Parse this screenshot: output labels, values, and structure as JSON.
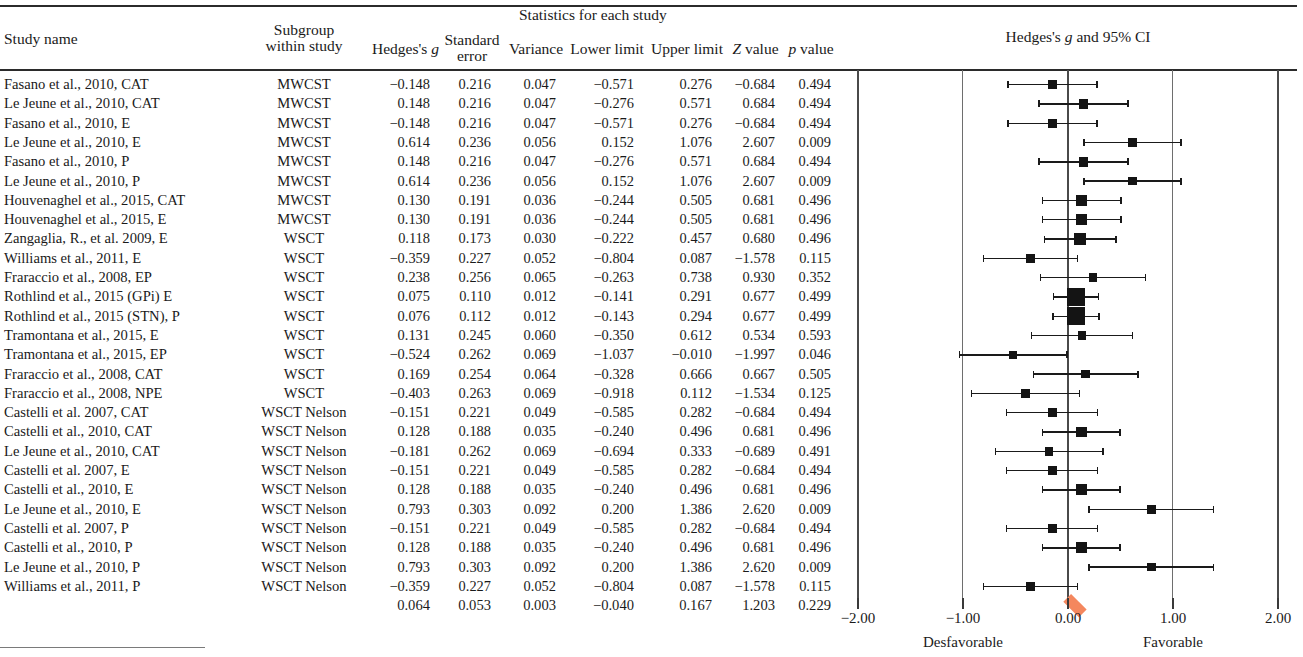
{
  "header": {
    "study_name": "Study name",
    "subgroup_line1": "Subgroup",
    "subgroup_line2": "within study",
    "statistics_group": "Statistics for each study",
    "hedges_g": "Hedges's g",
    "standard_line1": "Standard",
    "standard_line2": "error",
    "variance": "Variance",
    "lower_limit": "Lower limit",
    "upper_limit": "Upper limit",
    "z_value": "Z value",
    "p_value": "p value",
    "plot_title": "Hedges's g and 95% CI"
  },
  "axis": {
    "ticks": [
      "-2.00",
      "-1.00",
      "0.00",
      "1.00",
      "2.00"
    ],
    "tick_values": [
      -2,
      -1,
      0,
      1,
      2
    ],
    "left_label": "Desfavorable",
    "right_label": "Favorable",
    "xlim": [
      -2.2,
      2.2
    ],
    "summary_color": "#f4875e",
    "marker_color": "#141414"
  },
  "chart_data": {
    "type": "forest",
    "title": "Hedges's g and 95% CI",
    "xlabel": "",
    "ylabel": "",
    "xlim": [
      -2.2,
      2.2
    ],
    "grid": true,
    "effect_measure": "Hedges's g",
    "columns": [
      "Study name",
      "Subgroup within study",
      "Hedges's g",
      "Standard error",
      "Variance",
      "Lower limit",
      "Upper limit",
      "Z value",
      "p value"
    ],
    "rows": [
      {
        "study": "Fasano et al., 2010, CAT",
        "subgroup": "MWCST",
        "g": "-0.148",
        "se": "0.216",
        "var": "0.047",
        "lower": "-0.571",
        "upper": "0.276",
        "z": "-0.684",
        "p": "0.494",
        "g_v": -0.148,
        "se_v": 0.216,
        "lo_v": -0.571,
        "hi_v": 0.276
      },
      {
        "study": "Le Jeune et al., 2010, CAT",
        "subgroup": "MWCST",
        "g": "0.148",
        "se": "0.216",
        "var": "0.047",
        "lower": "-0.276",
        "upper": "0.571",
        "z": "0.684",
        "p": "0.494",
        "g_v": 0.148,
        "se_v": 0.216,
        "lo_v": -0.276,
        "hi_v": 0.571
      },
      {
        "study": "Fasano et al., 2010, E",
        "subgroup": "MWCST",
        "g": "-0.148",
        "se": "0.216",
        "var": "0.047",
        "lower": "-0.571",
        "upper": "0.276",
        "z": "-0.684",
        "p": "0.494",
        "g_v": -0.148,
        "se_v": 0.216,
        "lo_v": -0.571,
        "hi_v": 0.276
      },
      {
        "study": "Le Jeune et al., 2010, E",
        "subgroup": "MWCST",
        "g": "0.614",
        "se": "0.236",
        "var": "0.056",
        "lower": "0.152",
        "upper": "1.076",
        "z": "2.607",
        "p": "0.009",
        "g_v": 0.614,
        "se_v": 0.236,
        "lo_v": 0.152,
        "hi_v": 1.076
      },
      {
        "study": "Fasano et al., 2010, P",
        "subgroup": "MWCST",
        "g": "0.148",
        "se": "0.216",
        "var": "0.047",
        "lower": "-0.276",
        "upper": "0.571",
        "z": "0.684",
        "p": "0.494",
        "g_v": 0.148,
        "se_v": 0.216,
        "lo_v": -0.276,
        "hi_v": 0.571
      },
      {
        "study": "Le Jeune et al., 2010, P",
        "subgroup": "MWCST",
        "g": "0.614",
        "se": "0.236",
        "var": "0.056",
        "lower": "0.152",
        "upper": "1.076",
        "z": "2.607",
        "p": "0.009",
        "g_v": 0.614,
        "se_v": 0.236,
        "lo_v": 0.152,
        "hi_v": 1.076
      },
      {
        "study": "Houvenaghel et al., 2015, CAT",
        "subgroup": "MWCST",
        "g": "0.130",
        "se": "0.191",
        "var": "0.036",
        "lower": "-0.244",
        "upper": "0.505",
        "z": "0.681",
        "p": "0.496",
        "g_v": 0.13,
        "se_v": 0.191,
        "lo_v": -0.244,
        "hi_v": 0.505
      },
      {
        "study": "Houvenaghel et al., 2015, E",
        "subgroup": "MWCST",
        "g": "0.130",
        "se": "0.191",
        "var": "0.036",
        "lower": "-0.244",
        "upper": "0.505",
        "z": "0.681",
        "p": "0.496",
        "g_v": 0.13,
        "se_v": 0.191,
        "lo_v": -0.244,
        "hi_v": 0.505
      },
      {
        "study": "Zangaglia, R., et al. 2009, E",
        "subgroup": "WSCT",
        "g": "0.118",
        "se": "0.173",
        "var": "0.030",
        "lower": "-0.222",
        "upper": "0.457",
        "z": "0.680",
        "p": "0.496",
        "g_v": 0.118,
        "se_v": 0.173,
        "lo_v": -0.222,
        "hi_v": 0.457
      },
      {
        "study": "Williams et al., 2011, E",
        "subgroup": "WSCT",
        "g": "-0.359",
        "se": "0.227",
        "var": "0.052",
        "lower": "-0.804",
        "upper": "0.087",
        "z": "-1.578",
        "p": "0.115",
        "g_v": -0.359,
        "se_v": 0.227,
        "lo_v": -0.804,
        "hi_v": 0.087
      },
      {
        "study": "Fraraccio et al., 2008, EP",
        "subgroup": "WSCT",
        "g": "0.238",
        "se": "0.256",
        "var": "0.065",
        "lower": "-0.263",
        "upper": "0.738",
        "z": "0.930",
        "p": "0.352",
        "g_v": 0.238,
        "se_v": 0.256,
        "lo_v": -0.263,
        "hi_v": 0.738
      },
      {
        "study": "Rothlind et al., 2015 (GPi) E",
        "subgroup": "WSCT",
        "g": "0.075",
        "se": "0.110",
        "var": "0.012",
        "lower": "-0.141",
        "upper": "0.291",
        "z": "0.677",
        "p": "0.499",
        "g_v": 0.075,
        "se_v": 0.11,
        "lo_v": -0.141,
        "hi_v": 0.291
      },
      {
        "study": "Rothlind et al., 2015 (STN), P",
        "subgroup": "WSCT",
        "g": "0.076",
        "se": "0.112",
        "var": "0.012",
        "lower": "-0.143",
        "upper": "0.294",
        "z": "0.677",
        "p": "0.499",
        "g_v": 0.076,
        "se_v": 0.112,
        "lo_v": -0.143,
        "hi_v": 0.294
      },
      {
        "study": "Tramontana et al., 2015, E",
        "subgroup": "WSCT",
        "g": "0.131",
        "se": "0.245",
        "var": "0.060",
        "lower": "-0.350",
        "upper": "0.612",
        "z": "0.534",
        "p": "0.593",
        "g_v": 0.131,
        "se_v": 0.245,
        "lo_v": -0.35,
        "hi_v": 0.612
      },
      {
        "study": "Tramontana et al., 2015, EP",
        "subgroup": "WSCT",
        "g": "-0.524",
        "se": "0.262",
        "var": "0.069",
        "lower": "-1.037",
        "upper": "-0.010",
        "z": "-1.997",
        "p": "0.046",
        "g_v": -0.524,
        "se_v": 0.262,
        "lo_v": -1.037,
        "hi_v": -0.01
      },
      {
        "study": "Fraraccio et al., 2008, CAT",
        "subgroup": "WSCT",
        "g": "0.169",
        "se": "0.254",
        "var": "0.064",
        "lower": "-0.328",
        "upper": "0.666",
        "z": "0.667",
        "p": "0.505",
        "g_v": 0.169,
        "se_v": 0.254,
        "lo_v": -0.328,
        "hi_v": 0.666
      },
      {
        "study": "Fraraccio et al., 2008, NPE",
        "subgroup": "WSCT",
        "g": "-0.403",
        "se": "0.263",
        "var": "0.069",
        "lower": "-0.918",
        "upper": "0.112",
        "z": "-1.534",
        "p": "0.125",
        "g_v": -0.403,
        "se_v": 0.263,
        "lo_v": -0.918,
        "hi_v": 0.112
      },
      {
        "study": "Castelli et al. 2007, CAT",
        "subgroup": "WSCT Nelson",
        "g": "-0.151",
        "se": "0.221",
        "var": "0.049",
        "lower": "-0.585",
        "upper": "0.282",
        "z": "-0.684",
        "p": "0.494",
        "g_v": -0.151,
        "se_v": 0.221,
        "lo_v": -0.585,
        "hi_v": 0.282
      },
      {
        "study": "Castelli et al., 2010, CAT",
        "subgroup": "WSCT Nelson",
        "g": "0.128",
        "se": "0.188",
        "var": "0.035",
        "lower": "-0.240",
        "upper": "0.496",
        "z": "0.681",
        "p": "0.496",
        "g_v": 0.128,
        "se_v": 0.188,
        "lo_v": -0.24,
        "hi_v": 0.496
      },
      {
        "study": "Le Jeune et al., 2010, CAT",
        "subgroup": "WSCT Nelson",
        "g": "-0.181",
        "se": "0.262",
        "var": "0.069",
        "lower": "-0.694",
        "upper": "0.333",
        "z": "-0.689",
        "p": "0.491",
        "g_v": -0.181,
        "se_v": 0.262,
        "lo_v": -0.694,
        "hi_v": 0.333
      },
      {
        "study": "Castelli et al. 2007, E",
        "subgroup": "WSCT Nelson",
        "g": "-0.151",
        "se": "0.221",
        "var": "0.049",
        "lower": "-0.585",
        "upper": "0.282",
        "z": "-0.684",
        "p": "0.494",
        "g_v": -0.151,
        "se_v": 0.221,
        "lo_v": -0.585,
        "hi_v": 0.282
      },
      {
        "study": "Castelli et al., 2010, E",
        "subgroup": "WSCT Nelson",
        "g": "0.128",
        "se": "0.188",
        "var": "0.035",
        "lower": "-0.240",
        "upper": "0.496",
        "z": "0.681",
        "p": "0.496",
        "g_v": 0.128,
        "se_v": 0.188,
        "lo_v": -0.24,
        "hi_v": 0.496
      },
      {
        "study": "Le Jeune et al., 2010, E",
        "subgroup": "WSCT Nelson",
        "g": "0.793",
        "se": "0.303",
        "var": "0.092",
        "lower": "0.200",
        "upper": "1.386",
        "z": "2.620",
        "p": "0.009",
        "g_v": 0.793,
        "se_v": 0.303,
        "lo_v": 0.2,
        "hi_v": 1.386
      },
      {
        "study": "Castelli et al. 2007, P",
        "subgroup": "WSCT Nelson",
        "g": "-0.151",
        "se": "0.221",
        "var": "0.049",
        "lower": "-0.585",
        "upper": "0.282",
        "z": "-0.684",
        "p": "0.494",
        "g_v": -0.151,
        "se_v": 0.221,
        "lo_v": -0.585,
        "hi_v": 0.282
      },
      {
        "study": "Castelli et al., 2010, P",
        "subgroup": "WSCT Nelson",
        "g": "0.128",
        "se": "0.188",
        "var": "0.035",
        "lower": "-0.240",
        "upper": "0.496",
        "z": "0.681",
        "p": "0.496",
        "g_v": 0.128,
        "se_v": 0.188,
        "lo_v": -0.24,
        "hi_v": 0.496
      },
      {
        "study": "Le Jeune et al., 2010, P",
        "subgroup": "WSCT Nelson",
        "g": "0.793",
        "se": "0.303",
        "var": "0.092",
        "lower": "0.200",
        "upper": "1.386",
        "z": "2.620",
        "p": "0.009",
        "g_v": 0.793,
        "se_v": 0.303,
        "lo_v": 0.2,
        "hi_v": 1.386
      },
      {
        "study": "Williams et al., 2011, P",
        "subgroup": "WSCT Nelson",
        "g": "-0.359",
        "se": "0.227",
        "var": "0.052",
        "lower": "-0.804",
        "upper": "0.087",
        "z": "-1.578",
        "p": "0.115",
        "g_v": -0.359,
        "se_v": 0.227,
        "lo_v": -0.804,
        "hi_v": 0.087
      }
    ],
    "summary": {
      "study": "",
      "subgroup": "",
      "g": "0.064",
      "se": "0.053",
      "var": "0.003",
      "lower": "-0.040",
      "upper": "0.167",
      "z": "1.203",
      "p": "0.229",
      "g_v": 0.064,
      "lo_v": -0.04,
      "hi_v": 0.167
    }
  }
}
